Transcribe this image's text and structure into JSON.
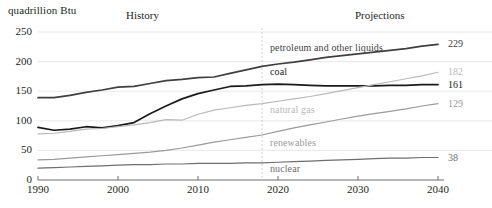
{
  "axis_unit": "quadrillion Btu",
  "period_labels": {
    "history": "History",
    "projections": "Projections"
  },
  "colors": {
    "petroleum": "#3f3f3f",
    "coal": "#1a1a1a",
    "natural_gas": "#b9b9b9",
    "renewables": "#9a9a9a",
    "nuclear": "#6e6e6e",
    "grid": "#e2e2e2",
    "axis": "#6e6e6e",
    "divider": "#c8c8c8",
    "text": "#231f20"
  },
  "chart_data": {
    "type": "line",
    "title": "",
    "subtitle": "",
    "xlabel": "",
    "ylabel": "quadrillion Btu",
    "xlim": [
      1990,
      2040
    ],
    "ylim": [
      0,
      250
    ],
    "grid": true,
    "legend_position": "inline-labels",
    "history_projection_split": 2018,
    "xticks": [
      "1990",
      "2000",
      "2010",
      "2020",
      "2030",
      "2040"
    ],
    "xtick_values": [
      1990,
      2000,
      2010,
      2020,
      2030,
      2040
    ],
    "yticks": [
      "0",
      "50",
      "100",
      "150",
      "200",
      "250"
    ],
    "ytick_values": [
      0,
      50,
      100,
      150,
      200,
      250
    ],
    "x": [
      1990,
      1992,
      1994,
      1996,
      1998,
      2000,
      2002,
      2004,
      2006,
      2008,
      2010,
      2012,
      2014,
      2016,
      2018,
      2020,
      2022,
      2024,
      2026,
      2028,
      2030,
      2032,
      2034,
      2036,
      2038,
      2040
    ],
    "series": [
      {
        "name": "petroleum and other liquids",
        "label": "petroleum and other liquids",
        "color": "#3f3f3f",
        "end_value": 229,
        "values": [
          139,
          139,
          143,
          148,
          152,
          157,
          158,
          163,
          168,
          170,
          173,
          174,
          180,
          186,
          192,
          196,
          199,
          203,
          207,
          210,
          213,
          216,
          219,
          222,
          226,
          229
        ]
      },
      {
        "name": "coal",
        "label": "coal",
        "color": "#1a1a1a",
        "end_value": 161,
        "values": [
          89,
          84,
          86,
          90,
          88,
          92,
          97,
          112,
          125,
          137,
          146,
          152,
          158,
          159,
          161,
          162,
          161,
          160,
          159,
          159,
          159,
          159,
          160,
          160,
          161,
          161
        ]
      },
      {
        "name": "natural gas",
        "label": "natural gas",
        "color": "#b9b9b9",
        "end_value": 182,
        "values": [
          78,
          79,
          82,
          86,
          87,
          90,
          93,
          97,
          102,
          101,
          111,
          118,
          122,
          126,
          129,
          133,
          137,
          141,
          146,
          151,
          156,
          161,
          166,
          171,
          176,
          182
        ]
      },
      {
        "name": "renewables",
        "label": "renewables",
        "color": "#9a9a9a",
        "end_value": 129,
        "values": [
          34,
          35,
          37,
          39,
          41,
          43,
          45,
          47,
          50,
          54,
          59,
          64,
          68,
          72,
          76,
          82,
          88,
          93,
          98,
          103,
          108,
          112,
          116,
          120,
          125,
          129
        ]
      },
      {
        "name": "nuclear",
        "label": "nuclear",
        "color": "#6e6e6e",
        "end_value": 38,
        "values": [
          20,
          21,
          22,
          23,
          24,
          25,
          26,
          26,
          27,
          27,
          28,
          28,
          28,
          29,
          29,
          30,
          31,
          32,
          33,
          34,
          35,
          36,
          37,
          37,
          38,
          38
        ]
      }
    ]
  }
}
